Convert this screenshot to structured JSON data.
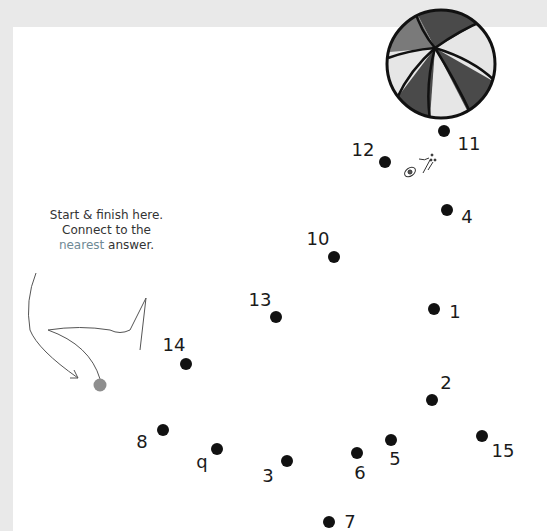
{
  "instructions": {
    "line1": "Start & finish here.",
    "line2": "Connect to the",
    "highlight": "nearest",
    "line3_rest": " answer.",
    "highlight_color": "#6f8a95"
  },
  "colors": {
    "background": "#e9e9e9",
    "panel": "#ffffff",
    "dot": "#111111",
    "start_dot": "#8e8e8e",
    "ball_dark": "#4a4a4a",
    "ball_mid": "#7a7a7a",
    "ball_light": "#e6e6e6"
  },
  "start_dot": {
    "x": 100,
    "y": 385
  },
  "dots": [
    {
      "label": "1",
      "x": 434,
      "y": 309,
      "lx": 455,
      "ly": 312
    },
    {
      "label": "2",
      "x": 432,
      "y": 400,
      "lx": 446,
      "ly": 383
    },
    {
      "label": "3",
      "x": 287,
      "y": 461,
      "lx": 268,
      "ly": 476
    },
    {
      "label": "4",
      "x": 447,
      "y": 210,
      "lx": 467,
      "ly": 217
    },
    {
      "label": "5",
      "x": 391,
      "y": 440,
      "lx": 395,
      "ly": 459
    },
    {
      "label": "6",
      "x": 357,
      "y": 453,
      "lx": 360,
      "ly": 473
    },
    {
      "label": "7",
      "x": 329,
      "y": 522,
      "lx": 350,
      "ly": 522
    },
    {
      "label": "8",
      "x": 163,
      "y": 430,
      "lx": 142,
      "ly": 442
    },
    {
      "label": "q",
      "x": 217,
      "y": 449,
      "lx": 202,
      "ly": 462
    },
    {
      "label": "10",
      "x": 334,
      "y": 257,
      "lx": 318,
      "ly": 239
    },
    {
      "label": "11",
      "x": 444,
      "y": 131,
      "lx": 469,
      "ly": 144
    },
    {
      "label": "12",
      "x": 385,
      "y": 162,
      "lx": 363,
      "ly": 150
    },
    {
      "label": "13",
      "x": 276,
      "y": 317,
      "lx": 260,
      "ly": 300
    },
    {
      "label": "14",
      "x": 186,
      "y": 364,
      "lx": 174,
      "ly": 345
    },
    {
      "label": "15",
      "x": 482,
      "y": 436,
      "lx": 503,
      "ly": 451
    }
  ]
}
